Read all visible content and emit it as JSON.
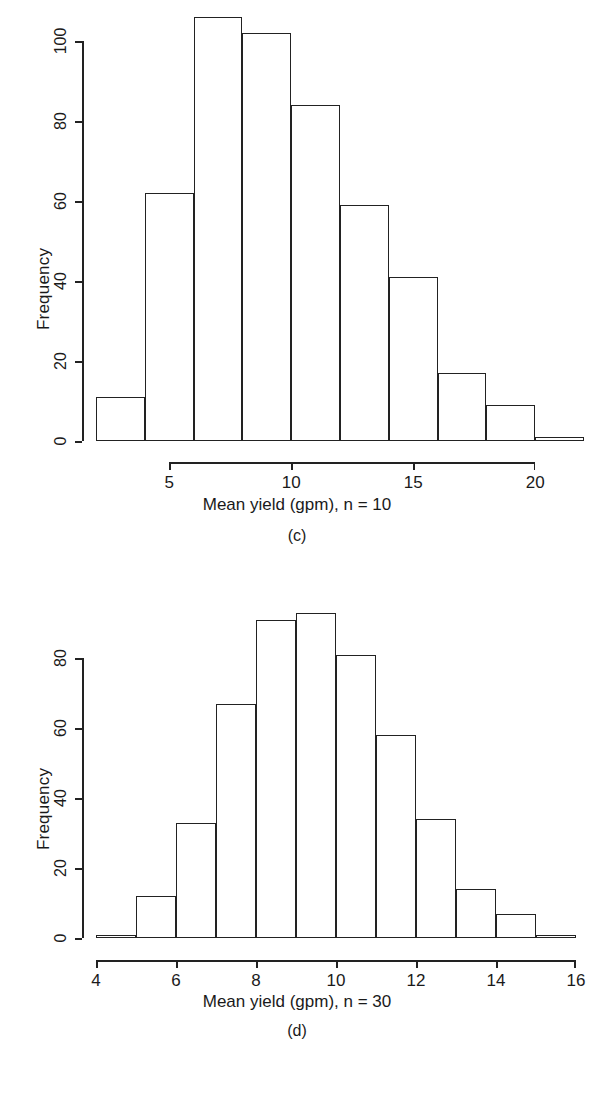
{
  "figure": {
    "background_color": "#ffffff",
    "line_color": "#222222"
  },
  "panels": [
    {
      "id": "c",
      "caption": "(c)",
      "xlabel": "Mean yield (gpm), n = 10",
      "ylabel": "Frequency",
      "ytick_labels": [
        "0",
        "20",
        "40",
        "60",
        "80",
        "100"
      ],
      "xtick_labels": [
        "5",
        "10",
        "15",
        "20"
      ]
    },
    {
      "id": "d",
      "caption": "(d)",
      "xlabel": "Mean yield (gpm), n = 30",
      "ylabel": "Frequency",
      "ytick_labels": [
        "0",
        "20",
        "40",
        "60",
        "80"
      ],
      "xtick_labels": [
        "4",
        "6",
        "8",
        "10",
        "12",
        "14",
        "16"
      ]
    }
  ],
  "chart_data": [
    {
      "type": "bar",
      "subplot": "(c)",
      "title": "",
      "xlabel": "Mean yield (gpm), n = 10",
      "ylabel": "Frequency",
      "bin_edges": [
        2,
        4,
        6,
        8,
        10,
        12,
        14,
        16,
        18,
        20,
        22
      ],
      "categories": [
        "2-4",
        "4-6",
        "6-8",
        "8-10",
        "10-12",
        "12-14",
        "14-16",
        "16-18",
        "18-20",
        "20-22"
      ],
      "values": [
        11,
        62,
        106,
        102,
        84,
        59,
        41,
        17,
        9,
        1
      ],
      "xlim": [
        2,
        22
      ],
      "ylim": [
        0,
        106
      ],
      "xticks": [
        5,
        10,
        15,
        20
      ],
      "yticks": [
        0,
        20,
        40,
        60,
        80,
        100
      ],
      "grid": false,
      "legend": false
    },
    {
      "type": "bar",
      "subplot": "(d)",
      "title": "",
      "xlabel": "Mean yield (gpm), n = 30",
      "ylabel": "Frequency",
      "bin_edges": [
        4,
        5,
        6,
        7,
        8,
        9,
        10,
        11,
        12,
        13,
        14,
        15,
        16
      ],
      "categories": [
        "4-5",
        "5-6",
        "6-7",
        "7-8",
        "8-9",
        "9-10",
        "10-11",
        "11-12",
        "12-13",
        "13-14",
        "14-15",
        "15-16"
      ],
      "values": [
        1,
        12,
        33,
        67,
        91,
        93,
        81,
        58,
        34,
        14,
        7,
        1
      ],
      "xlim": [
        4,
        16
      ],
      "ylim": [
        0,
        93
      ],
      "xticks": [
        4,
        6,
        8,
        10,
        12,
        14,
        16
      ],
      "yticks": [
        0,
        20,
        40,
        60,
        80
      ],
      "grid": false,
      "legend": false
    }
  ]
}
